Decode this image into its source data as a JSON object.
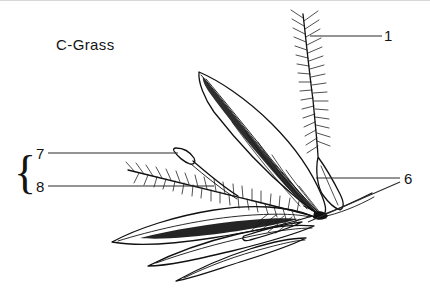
{
  "figure": {
    "title": "C-Grass",
    "background_color": "#ffffff",
    "ink_color": "#111111",
    "leader_color": "#2b2b2b",
    "frame_color": "#d8d8d8",
    "width": 430,
    "height": 290
  },
  "callouts": [
    {
      "id": "callout-1",
      "label": "1",
      "x": 404,
      "y": 184,
      "target": "spikelet-base-node",
      "leader_style": "two-lines-converging"
    },
    {
      "id": "callout-6",
      "label": "6",
      "x": 386,
      "y": 41,
      "target": "plumose-awn-upper",
      "leader_style": "horizontal"
    },
    {
      "id": "callout-7",
      "label": "7",
      "x": 36,
      "y": 192,
      "target": "plumose-bristle-lower",
      "leader_style": "horizontal"
    },
    {
      "id": "callout-8",
      "label": "8",
      "x": 36,
      "y": 159,
      "target": "club-stalk-detail",
      "leader_style": "horizontal"
    }
  ],
  "brace": {
    "glyph": "{",
    "groups": [
      "8",
      "7"
    ],
    "x": 14,
    "y": 188
  },
  "parts": {
    "upper_bract": "large-lanceolate-bract",
    "upper_awn": "plumose-awn-upper",
    "lower_bristle": "plumose-bristle-lower",
    "club_stalk": "club-stalk-detail",
    "lower_blades": "lower-leaf-blade-cluster",
    "base_node": "spikelet-base-node"
  }
}
